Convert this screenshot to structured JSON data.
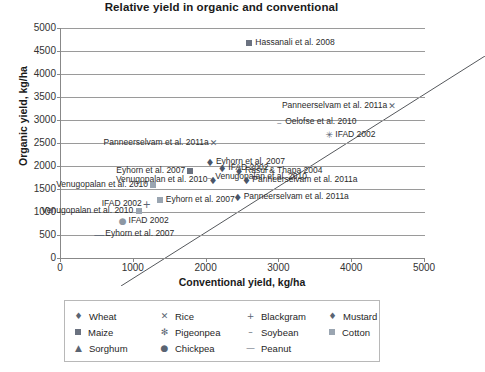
{
  "chart_data": {
    "type": "scatter",
    "title": "Relative yield in organic and conventional",
    "xlabel": "Conventional yield, kg/ha",
    "ylabel": "Organic yield, kg/ha",
    "xlim": [
      0,
      5000
    ],
    "ylim": [
      0,
      5000
    ],
    "xticks": [
      0,
      1000,
      2000,
      3000,
      4000,
      5000
    ],
    "yticks": [
      0,
      500,
      1000,
      1500,
      2000,
      2500,
      3000,
      3500,
      4000,
      4500,
      5000
    ],
    "grid": "horizontal",
    "reference_line": {
      "label": "1:1 line",
      "from": [
        0,
        0
      ],
      "to": [
        5000,
        5000
      ]
    },
    "legend_position": "below-plot",
    "series": [
      {
        "name": "Wheat",
        "symbol": "diamond"
      },
      {
        "name": "Rice",
        "symbol": "x"
      },
      {
        "name": "Blackgram",
        "symbol": "plus"
      },
      {
        "name": "Mustard",
        "symbol": "diamond-light"
      },
      {
        "name": "Maize",
        "symbol": "square-dark"
      },
      {
        "name": "Pigeonpea",
        "symbol": "asterisk"
      },
      {
        "name": "Soybean",
        "symbol": "dash"
      },
      {
        "name": "Cotton",
        "symbol": "square-light"
      },
      {
        "name": "Sorghum",
        "symbol": "triangle"
      },
      {
        "name": "Chickpea",
        "symbol": "circle"
      },
      {
        "name": "Peanut",
        "symbol": "em-dash"
      }
    ],
    "points": [
      {
        "label": "Hassanali et al. 2008",
        "series": "Maize",
        "x": 2600,
        "y": 4670,
        "label_pos": "right"
      },
      {
        "label": "Panneerselvam et al. 2011a",
        "series": "Rice",
        "x": 4560,
        "y": 3300,
        "label_pos": "left"
      },
      {
        "label": "Oelofse et al. 2010",
        "series": "Soybean",
        "x": 3010,
        "y": 2960,
        "label_pos": "right"
      },
      {
        "label": "IFAD 2002",
        "series": "Pigeonpea",
        "x": 3700,
        "y": 2680,
        "label_pos": "right"
      },
      {
        "label": "Panneerselvam et al. 2011a",
        "series": "Rice",
        "x": 2110,
        "y": 2500,
        "label_pos": "left"
      },
      {
        "label": "Eyhorn et al. 2007",
        "series": "Wheat",
        "x": 2060,
        "y": 2080,
        "label_pos": "right"
      },
      {
        "label": "IFAD 2002",
        "series": "Wheat",
        "x": 2230,
        "y": 1960,
        "label_pos": "right"
      },
      {
        "label": "Rasul & Thapa 2004",
        "series": "Wheat",
        "x": 2460,
        "y": 1900,
        "label_pos": "right"
      },
      {
        "label": "Eyhorn et al. 2007",
        "series": "Maize",
        "x": 1790,
        "y": 1900,
        "label_pos": "left"
      },
      {
        "label": "Venugopalan et al. 2010",
        "series": "Soybean",
        "x": 2050,
        "y": 1760,
        "label_pos": "right"
      },
      {
        "label": "Venugopalan et al. 2010",
        "series": "Cotton",
        "x": 1280,
        "y": 1580,
        "label_pos": "left"
      },
      {
        "label": "Panneerselvam et al. 2011a",
        "series": "Wheat",
        "x": 2560,
        "y": 1700,
        "label_pos": "right"
      },
      {
        "label": "Venugopalan et al. 2010",
        "series": "Wheat",
        "x": 2100,
        "y": 1700,
        "label_pos": "left"
      },
      {
        "label": "Panneerselvam et al. 2011a",
        "series": "Wheat",
        "x": 2440,
        "y": 1330,
        "label_pos": "right"
      },
      {
        "label": "IFAD 2002",
        "series": "Blackgram",
        "x": 1190,
        "y": 1180,
        "label_pos": "left"
      },
      {
        "label": "Eyhorn et al. 2007",
        "series": "Cotton",
        "x": 1370,
        "y": 1270,
        "label_pos": "right"
      },
      {
        "label": "Venugopalan et al. 2010",
        "series": "Cotton",
        "x": 1080,
        "y": 1030,
        "label_pos": "left"
      },
      {
        "label": "IFAD 2002",
        "series": "Chickpea",
        "x": 860,
        "y": 800,
        "label_pos": "right"
      },
      {
        "label": "Eyhorn et al. 2007",
        "series": "Peanut",
        "x": 540,
        "y": 520,
        "label_pos": "right"
      }
    ]
  },
  "legend": {
    "rows": [
      [
        {
          "symbol": "♦",
          "kind": "glyph",
          "cls": "wheat",
          "label": "Wheat"
        },
        {
          "symbol": "✕",
          "kind": "glyph",
          "cls": "rice",
          "label": "Rice"
        },
        {
          "symbol": "+",
          "kind": "glyph",
          "cls": "blackgram",
          "label": "Blackgram"
        },
        {
          "symbol": "♦",
          "kind": "glyph",
          "cls": "mustard",
          "label": "Mustard"
        }
      ],
      [
        {
          "symbol": "",
          "kind": "sq",
          "cls": "maize",
          "label": "Maize"
        },
        {
          "symbol": "✻",
          "kind": "glyph",
          "cls": "pigeonpea",
          "label": "Pigeonpea"
        },
        {
          "symbol": "–",
          "kind": "glyph",
          "cls": "soybean",
          "label": "Soybean"
        },
        {
          "symbol": "",
          "kind": "sqlight",
          "cls": "cotton",
          "label": "Cotton"
        }
      ],
      [
        {
          "symbol": "▲",
          "kind": "glyph",
          "cls": "sorghum",
          "label": "Sorghum"
        },
        {
          "symbol": "●",
          "kind": "glyph",
          "cls": "chickpea",
          "label": "Chickpea"
        },
        {
          "symbol": "—",
          "kind": "glyph",
          "cls": "peanut",
          "label": "Peanut"
        },
        {
          "symbol": "",
          "kind": "empty",
          "cls": "",
          "label": ""
        }
      ]
    ]
  },
  "colors": {
    "grid": "#9a9a9a",
    "axis": "#888888",
    "marker_dark": "#4a5568",
    "marker_light": "#9aa5b1",
    "text": "#2b2b2b",
    "title": "#1a1a1a"
  }
}
